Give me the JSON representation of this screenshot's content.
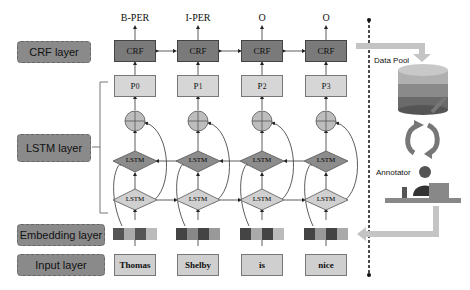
{
  "diagram": {
    "layers": {
      "crf": "CRF layer",
      "lstm": "LSTM layer",
      "embedding": "Embedding layer",
      "input": "Input layer"
    },
    "columns": [
      {
        "output": "B-PER",
        "crf": "CRF",
        "p_base": "P",
        "p_sub": "0",
        "word": "Thomas",
        "embedding_colors": [
          "#555555",
          "#aaaaaa",
          "#555555",
          "#bbbbbb"
        ]
      },
      {
        "output": "I-PER",
        "crf": "CRF",
        "p_base": "P",
        "p_sub": "1",
        "word": "Shelby",
        "embedding_colors": [
          "#444444",
          "#888888",
          "#444444",
          "#999999"
        ]
      },
      {
        "output": "O",
        "crf": "CRF",
        "p_base": "P",
        "p_sub": "2",
        "word": "is",
        "embedding_colors": [
          "#444444",
          "#aaaaaa",
          "#444444",
          "#bbbbbb"
        ]
      },
      {
        "output": "O",
        "crf": "CRF",
        "p_base": "P",
        "p_sub": "3",
        "word": "nice",
        "embedding_colors": [
          "#444444",
          "#999999",
          "#444444",
          "#aaaaaa"
        ]
      }
    ],
    "lstm_label": "LSTM",
    "right_panel": {
      "data_pool": "Data Pool",
      "annotator": "Annotator"
    },
    "colors": {
      "crf_fill": "#7a7a7a",
      "p_fill": "#d6d6d6",
      "lstm_top_fill": "#8c8c8c",
      "lstm_bottom_fill": "#d0d0d0",
      "circle_fill": "#bdbdbd",
      "label_fill": "#8a8a8a",
      "arrow_fill": "#c4c4c4"
    }
  }
}
